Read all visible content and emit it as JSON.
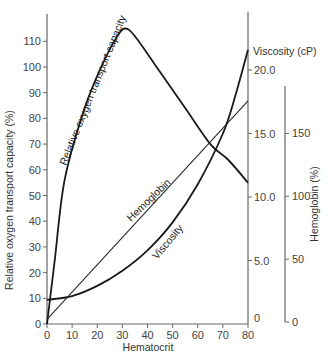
{
  "chart_data": {
    "type": "line",
    "title": "",
    "xlabel": "Hematocrit",
    "xlim": [
      0,
      80
    ],
    "x_ticks": [
      0,
      10,
      20,
      30,
      40,
      50,
      60,
      70,
      80
    ],
    "axes": {
      "left": {
        "label": "Relative oxygen transport capacity (%)",
        "ylim": [
          0,
          118
        ],
        "ticks": [
          0,
          10,
          20,
          30,
          40,
          50,
          60,
          70,
          80,
          90,
          100,
          110
        ]
      },
      "right_inner": {
        "label": "Viscosity (cP)",
        "ylim": [
          0,
          23
        ],
        "ticks": [
          "0",
          "5.0",
          "10.0",
          "15.0",
          "20.0"
        ]
      },
      "right_outer": {
        "label": "Hemoglobin (%)",
        "ylim": [
          0,
          185
        ],
        "ticks": [
          0,
          50,
          100,
          150
        ]
      }
    },
    "grid": false,
    "legend": "inline curve labels",
    "series": [
      {
        "name": "Relative oxygen transport capacity",
        "axis": "left",
        "x": [
          0,
          3,
          7,
          15,
          23,
          28,
          31,
          35,
          45,
          55,
          65,
          72,
          80
        ],
        "y": [
          0,
          24,
          56,
          84,
          103,
          112,
          115,
          112,
          98,
          84,
          70,
          64,
          55
        ]
      },
      {
        "name": "Hemoglobin",
        "axis": "right_outer",
        "x": [
          0,
          80
        ],
        "y": [
          2,
          176
        ]
      },
      {
        "name": "Viscosity",
        "axis": "right_inner",
        "x": [
          0,
          10,
          20,
          30,
          40,
          50,
          60,
          70,
          75,
          80
        ],
        "y": [
          1.9,
          2.2,
          3.0,
          4.2,
          5.8,
          8.0,
          11.0,
          15.0,
          18.0,
          21.6
        ]
      }
    ],
    "curve_labels": {
      "oxygen": "Relative oxygen transport capacity",
      "hemoglobin": "Hemoglobin",
      "viscosity": "Viscosity"
    }
  }
}
